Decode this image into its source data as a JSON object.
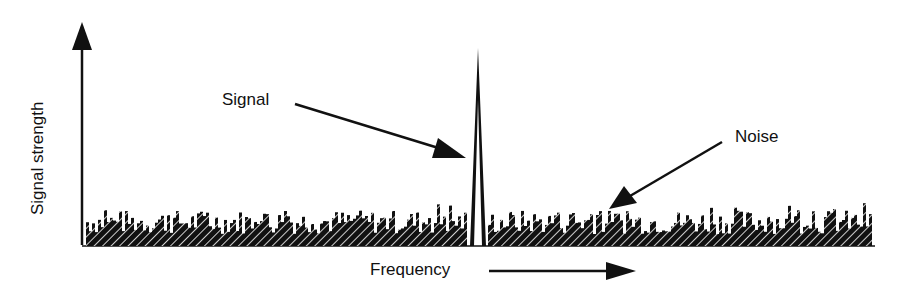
{
  "diagram": {
    "type": "spectrum",
    "labels": {
      "y_axis": "Signal strength",
      "x_axis": "Frequency",
      "signal": "Signal",
      "noise": "Noise"
    },
    "colors": {
      "ink": "#111111",
      "background": "#ffffff"
    }
  },
  "chart_data": {
    "type": "bar",
    "title": "",
    "xlabel": "Frequency",
    "ylabel": "Signal strength",
    "series": [
      {
        "name": "Signal",
        "peak_position": 0.5,
        "relative_height": 1.0
      },
      {
        "name": "Noise",
        "relative_height_range": [
          0.1,
          0.22
        ]
      }
    ],
    "annotations": [
      "Signal",
      "Noise"
    ],
    "grid": false
  }
}
